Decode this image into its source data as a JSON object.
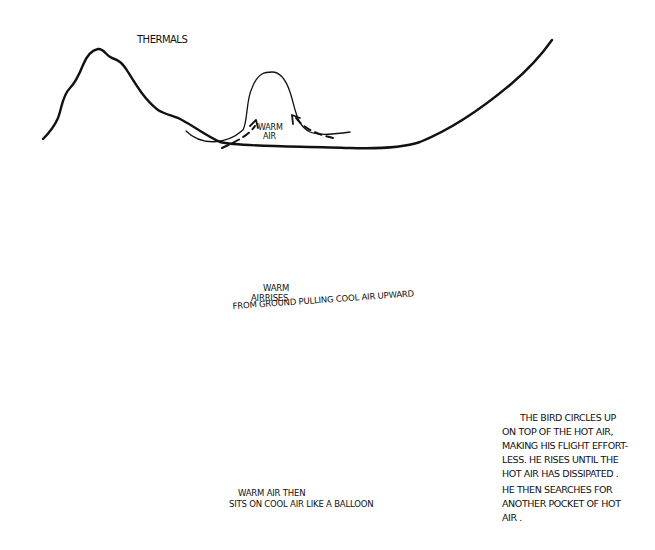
{
  "title": "THERMALS",
  "panels": [
    {
      "id": "panel-1",
      "label_lines": [
        "WARM",
        "AIR"
      ]
    },
    {
      "id": "panel-2",
      "label_lines": [
        "WARM",
        "AIRRISES",
        "FROM GROUND PULLING COOL AIR UPWARD"
      ]
    },
    {
      "id": "panel-3",
      "label_lines": [
        "WARM AIR THEN",
        "SITS ON COOL AIR LIKE A BALLOON"
      ]
    }
  ],
  "explanation": {
    "lines": [
      "THE BIRD CIRCLES UP",
      "ON TOP OF THE HOT AIR,",
      "MAKING HIS FLIGHT EFFORT-",
      "LESS. HE RISES UNTIL THE",
      "HOT AIR HAS DISSIPATED .",
      "HE THEN SEARCHES FOR",
      "ANOTHER POCKET OF HOT",
      "AIR ."
    ]
  },
  "icons": [
    "mountain-valley-line",
    "thermal-bubble",
    "dashed-circulation-arrow",
    "bird-silhouette"
  ],
  "colors": {
    "ink": "#111111",
    "paper": "#ffffff"
  }
}
